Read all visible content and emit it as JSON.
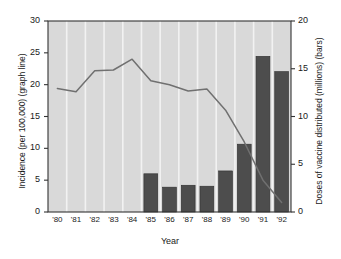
{
  "chart_data": {
    "type": "bar",
    "title": "",
    "xlabel": "Year",
    "ylabel": "Incidence (per 100,000) (graph line)",
    "ylabel_right": "Doses of vaccine distributed (millions) (bars)",
    "categories": [
      "'80",
      "'81",
      "'82",
      "'83",
      "'84",
      "'85",
      "'86",
      "'87",
      "'88",
      "'89",
      "'90",
      "'91",
      "'92"
    ],
    "ylim": [
      0,
      30
    ],
    "yticks": [
      0,
      5,
      10,
      15,
      20,
      25,
      30
    ],
    "ylim_right": [
      0,
      20
    ],
    "yticks_right": [
      0,
      5,
      10,
      15,
      20
    ],
    "grid": "vertical-white",
    "legend": "none",
    "series": [
      {
        "name": "Doses of vaccine distributed (millions)",
        "type": "bar",
        "axis": "right",
        "values": [
          null,
          null,
          null,
          null,
          null,
          4.0,
          2.6,
          2.8,
          2.7,
          4.3,
          7.1,
          16.3,
          14.7
        ]
      },
      {
        "name": "Incidence (per 100,000)",
        "type": "line",
        "axis": "left",
        "values": [
          19.4,
          18.9,
          22.2,
          22.3,
          24.0,
          20.6,
          20.0,
          19.0,
          19.3,
          16.0,
          11.0,
          5.0,
          1.5
        ]
      }
    ]
  },
  "colors": {
    "plot_background": "#d9d9d9",
    "gridline": "#f2f2f2",
    "bar": "#4d4d4d",
    "line": "#707070",
    "axis": "#333333",
    "text": "#1a1a1a"
  },
  "axes": {
    "left_title": "Incidence (per 100,000) (graph line)",
    "right_title": "Doses of vaccine distributed (millions) (bars)",
    "x_title": "Year"
  },
  "caption": ""
}
